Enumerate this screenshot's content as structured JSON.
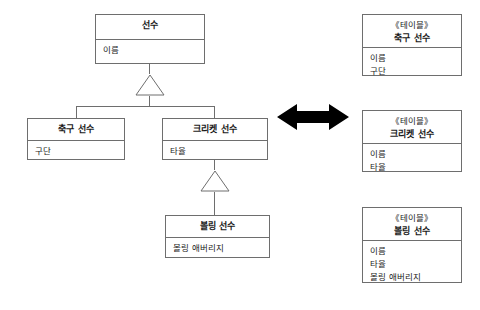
{
  "diagram": {
    "stroke_color": "#6e6e6e",
    "arrow_color": "#000000",
    "background": "#ffffff"
  },
  "classes": {
    "player": {
      "name": "선수",
      "attributes": [
        "이름"
      ]
    },
    "soccer_player": {
      "name": "축구 선수",
      "attributes": [
        "구단"
      ]
    },
    "cricket_player": {
      "name": "크리켓 선수",
      "attributes": [
        "타율"
      ]
    },
    "bowling_player": {
      "name": "볼링 선수",
      "attributes": [
        "볼링 애버리지"
      ]
    }
  },
  "tables": {
    "stereotype": "《테이블》",
    "soccer": {
      "stereotype": "《테이블》",
      "name": "축구 선수",
      "columns": [
        "이름",
        "구단"
      ]
    },
    "cricket": {
      "stereotype": "《테이블》",
      "name": "크리켓 선수",
      "columns": [
        "이름",
        "타율"
      ]
    },
    "bowling": {
      "stereotype": "《테이블》",
      "name": "볼링 선수",
      "columns": [
        "이름",
        "타율",
        "볼링 애버리지"
      ]
    }
  },
  "connectors": {
    "generalization_top": "generalization-triangle",
    "generalization_bottom": "generalization-triangle",
    "mapping": "double-headed-arrow"
  }
}
